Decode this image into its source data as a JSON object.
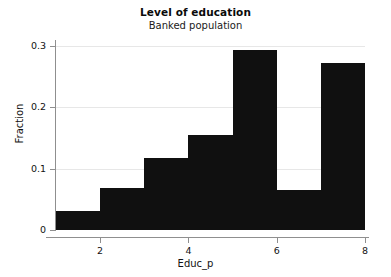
{
  "chart_data": {
    "type": "bar",
    "title": "Level of education",
    "subtitle": "Banked population",
    "xlabel": "Educ_p",
    "ylabel": "Fraction",
    "orientation": "vertical",
    "grid": "horizontal",
    "legend": "none",
    "bar_color": "#101010",
    "grid_color": "#e7e7e7",
    "axis_color": "#8f8f8f",
    "xlim": [
      1,
      8
    ],
    "ylim": [
      0,
      0.31
    ],
    "x_ticks": [
      2,
      4,
      6,
      8
    ],
    "x_tick_labels": [
      "2",
      "4",
      "6",
      "8"
    ],
    "y_ticks": [
      0,
      0.1,
      0.2,
      0.3
    ],
    "y_tick_labels": [
      "0",
      "0.1",
      "0.2",
      "0.3"
    ],
    "bin_width": 1,
    "categories": [
      "1-2",
      "2-3",
      "3-4",
      "4-5",
      "5-6",
      "6-7",
      "7-8"
    ],
    "bin_edges": [
      1,
      2,
      3,
      4,
      5,
      6,
      7,
      8
    ],
    "values": [
      0.031,
      0.068,
      0.117,
      0.155,
      0.293,
      0.065,
      0.272
    ]
  }
}
